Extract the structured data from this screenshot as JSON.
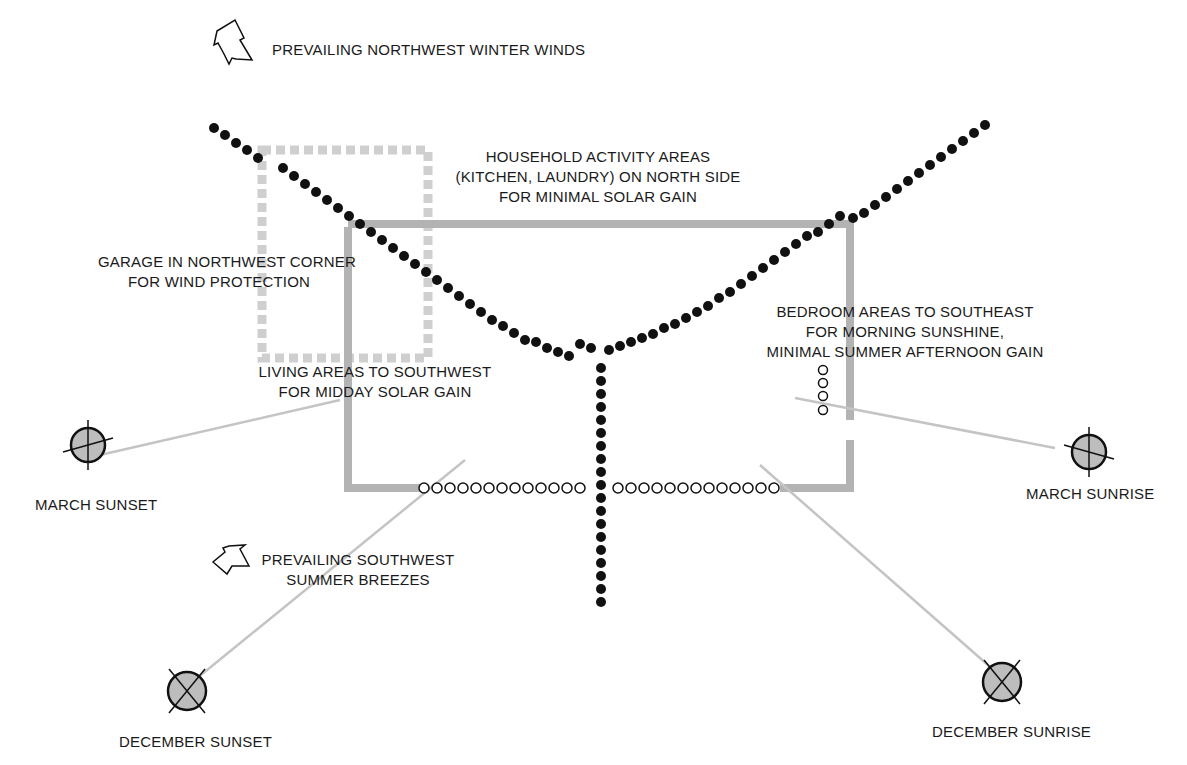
{
  "colors": {
    "ink": "#111111",
    "house_outline": "#b0b0b0",
    "garage_outline": "#c8c8c8",
    "sun_fill": "#b5b5b5",
    "sun_line": "#c0c0c0"
  },
  "labels": {
    "winter_winds": "PREVAILING NORTHWEST WINTER WINDS",
    "household": [
      "HOUSEHOLD ACTIVITY AREAS",
      "(KITCHEN, LAUNDRY) ON NORTH SIDE",
      "FOR MINIMAL SOLAR GAIN"
    ],
    "garage": [
      "GARAGE IN NORTHWEST CORNER",
      "FOR WIND PROTECTION"
    ],
    "bedroom": [
      "BEDROOM AREAS TO SOUTHEAST",
      "FOR MORNING SUNSHINE,",
      "MINIMAL SUMMER AFTERNOON GAIN"
    ],
    "living": [
      "LIVING AREAS TO SOUTHWEST",
      "FOR MIDDAY SOLAR GAIN"
    ],
    "summer_breezes": [
      "PREVAILING SOUTHWEST",
      "SUMMER BREEZES"
    ],
    "march_sunset": "MARCH SUNSET",
    "march_sunrise": "MARCH SUNRISE",
    "december_sunset": "DECEMBER SUNSET",
    "december_sunrise": "DECEMBER SUNRISE"
  },
  "icons": {
    "winter_wind_arrow": "arrow-pointing-southeast",
    "summer_breeze_arrow": "arrow-pointing-northeast",
    "sun_symbol": "crossed-circle"
  }
}
